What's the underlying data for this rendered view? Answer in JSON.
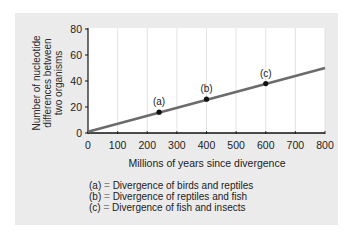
{
  "chart_data": {
    "type": "line",
    "title": "",
    "xlabel": "Millions of years since divergence",
    "ylabel": "Number of nucleotide differences between two organisms",
    "ylabel_lines": [
      "Number of nucleotide",
      "differences between",
      "two organisms"
    ],
    "xlim": [
      0,
      800
    ],
    "ylim": [
      0,
      80
    ],
    "xticks": [
      0,
      100,
      200,
      300,
      400,
      500,
      600,
      700,
      800
    ],
    "yticks": [
      0,
      20,
      40,
      60,
      80
    ],
    "grid": {
      "vertical": true,
      "horizontal": false
    },
    "series": [
      {
        "name": "Nucleotide differences trend",
        "line": {
          "x": [
            0,
            800
          ],
          "y": [
            1,
            50
          ]
        },
        "color": "#6b6b6b"
      }
    ],
    "points": [
      {
        "label": "(a)",
        "x": 240,
        "y": 16
      },
      {
        "label": "(b)",
        "x": 400,
        "y": 26
      },
      {
        "label": "(c)",
        "x": 600,
        "y": 38
      }
    ],
    "legend_position": "bottom",
    "annotations": [
      {
        "key": "(a)",
        "text": "Divergence of birds and reptiles"
      },
      {
        "key": "(b)",
        "text": "Divergence of reptiles and fish"
      },
      {
        "key": "(c)",
        "text": "Divergence of fish and insects"
      }
    ]
  },
  "axis": {
    "xtick_labels": [
      "0",
      "100",
      "200",
      "300",
      "400",
      "500",
      "600",
      "700",
      "800"
    ],
    "ytick_labels": [
      "80",
      "60",
      "40",
      "20",
      "0"
    ]
  },
  "legend": {
    "equals": "=",
    "items": [
      {
        "key": "(a)",
        "text": "Divergence of birds and reptiles"
      },
      {
        "key": "(b)",
        "text": "Divergence of reptiles and fish"
      },
      {
        "key": "(c)",
        "text": "Divergence of fish and insects"
      }
    ]
  },
  "colors": {
    "panel": "#ebebeb",
    "plot_bg": "#ffffff",
    "line": "#6b6b6b",
    "points": "#111111",
    "gridline": "#dcdcdc"
  }
}
